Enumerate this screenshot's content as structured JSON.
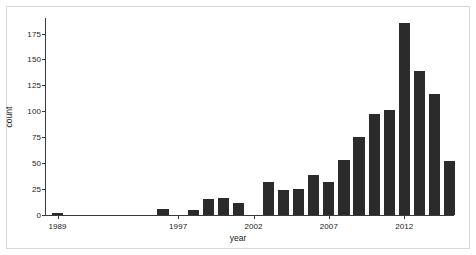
{
  "chart_data": {
    "type": "bar",
    "title": "",
    "xlabel": "year",
    "ylabel": "count",
    "ylim": [
      0,
      190
    ],
    "xlim": [
      1988.2,
      2015.3
    ],
    "grid": false,
    "legend": null,
    "bar_color": "#2b2b2b",
    "axis_color": "#3a3a3a",
    "frame_color": "#d8d8d8",
    "background": "#ffffff",
    "ytick_labels": [
      "0",
      "25",
      "50",
      "75",
      "100",
      "125",
      "150",
      "175"
    ],
    "ytick_values": [
      0,
      25,
      50,
      75,
      100,
      125,
      150,
      175
    ],
    "xtick_labels": [
      "1989",
      "1997",
      "2002",
      "2007",
      "2012"
    ],
    "xtick_values": [
      1989,
      1997,
      2002,
      2007,
      2012
    ],
    "categories": [
      1989,
      1990,
      1991,
      1992,
      1993,
      1994,
      1995,
      1996,
      1997,
      1998,
      1999,
      2000,
      2001,
      2002,
      2003,
      2004,
      2005,
      2006,
      2007,
      2008,
      2009,
      2010,
      2011,
      2012,
      2013,
      2014
    ],
    "values": [
      2,
      0,
      0,
      0,
      0,
      0,
      0,
      6,
      0,
      5,
      15,
      16,
      12,
      0,
      32,
      24,
      25,
      39,
      32,
      53,
      75,
      97,
      101,
      185,
      139,
      117
    ],
    "series": [
      {
        "name": "count",
        "values": [
          2,
          0,
          0,
          0,
          0,
          0,
          0,
          6,
          0,
          5,
          15,
          16,
          12,
          0,
          32,
          24,
          25,
          39,
          32,
          53,
          75,
          97,
          101,
          185,
          139,
          117
        ]
      }
    ],
    "bars": [
      {
        "year": 1989,
        "value": 2
      },
      {
        "year": 1996,
        "value": 6
      },
      {
        "year": 1998,
        "value": 5
      },
      {
        "year": 1999,
        "value": 15
      },
      {
        "year": 2000,
        "value": 16
      },
      {
        "year": 2001,
        "value": 12
      },
      {
        "year": 2003,
        "value": 32
      },
      {
        "year": 2004,
        "value": 24
      },
      {
        "year": 2005,
        "value": 25
      },
      {
        "year": 2006,
        "value": 39
      },
      {
        "year": 2007,
        "value": 32
      },
      {
        "year": 2008,
        "value": 53
      },
      {
        "year": 2009,
        "value": 75
      },
      {
        "year": 2010,
        "value": 97
      },
      {
        "year": 2011,
        "value": 101
      },
      {
        "year": 2012,
        "value": 185
      },
      {
        "year": 2013,
        "value": 139
      },
      {
        "year": 2014,
        "value": 117
      },
      {
        "year": 2015,
        "value": 52
      }
    ]
  }
}
